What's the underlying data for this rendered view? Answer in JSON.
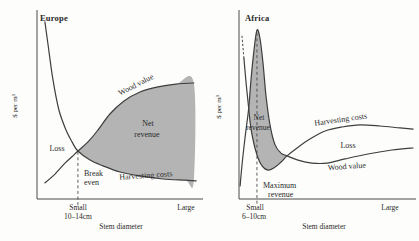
{
  "figure": {
    "background": "#fdfdfb",
    "line_color": "#3e3e3e",
    "shade_color": "#b4b4b4",
    "text_color": "#2a2a2a"
  },
  "chart_data": [
    {
      "type": "line",
      "title": "Europe",
      "xlabel": "Stem diameter",
      "ylabel": "$ per m³",
      "x_axis": "qualitative, Small (10–14cm) to Large",
      "y_axis": "qualitative, $ per m³ (no numeric ticks)",
      "grid": false,
      "legend_position": "labels on curves",
      "series_names": [
        "Harvesting costs",
        "Wood value"
      ],
      "shaded_region_meaning": "Net revenue (area where wood value exceeds harvesting costs, right of break-even point)",
      "annotation": "Break even at Small (10–14cm) stem diameter; Loss region left of break-even",
      "labels": {
        "title": "Europe",
        "ylabel": "$ per m³",
        "wood_value": "Wood value",
        "harvesting": "Harvesting costs",
        "net_line1": "Net",
        "net_line2": "revenue",
        "loss": "Loss",
        "break_line1": "Break",
        "break_line2": "even",
        "tick_small": "Small",
        "tick_small_size": "10–14cm",
        "tick_large": "Large",
        "xlabel": "Stem diameter"
      },
      "curves": {
        "harvesting": [
          [
            0.048,
            0.937
          ],
          [
            0.067,
            0.815
          ],
          [
            0.097,
            0.63
          ],
          [
            0.133,
            0.471
          ],
          [
            0.176,
            0.365
          ],
          [
            0.212,
            0.302
          ],
          [
            0.248,
            0.254
          ],
          [
            0.321,
            0.206
          ],
          [
            0.4,
            0.175
          ],
          [
            0.503,
            0.143
          ],
          [
            0.624,
            0.122
          ],
          [
            0.764,
            0.106
          ],
          [
            0.897,
            0.1
          ],
          [
            0.964,
            0.096
          ]
        ],
        "wood": [
          [
            0.048,
            0.085
          ],
          [
            0.109,
            0.132
          ],
          [
            0.17,
            0.19
          ],
          [
            0.215,
            0.226
          ],
          [
            0.248,
            0.254
          ],
          [
            0.309,
            0.302
          ],
          [
            0.37,
            0.365
          ],
          [
            0.442,
            0.45
          ],
          [
            0.527,
            0.519
          ],
          [
            0.624,
            0.566
          ],
          [
            0.733,
            0.593
          ],
          [
            0.842,
            0.608
          ],
          [
            0.95,
            0.614
          ]
        ]
      },
      "region": [
        [
          0.248,
          0.254
        ],
        [
          0.309,
          0.302
        ],
        [
          0.37,
          0.365
        ],
        [
          0.442,
          0.45
        ],
        [
          0.527,
          0.519
        ],
        [
          0.624,
          0.566
        ],
        [
          0.733,
          0.593
        ],
        [
          0.842,
          0.608
        ],
        [
          0.95,
          0.614
        ],
        [
          0.95,
          0.096
        ],
        [
          0.897,
          0.1
        ],
        [
          0.764,
          0.106
        ],
        [
          0.624,
          0.122
        ],
        [
          0.503,
          0.143
        ],
        [
          0.4,
          0.175
        ],
        [
          0.321,
          0.206
        ]
      ],
      "marker_line": {
        "x": 0.248,
        "y1": 0.25,
        "y2": -0.037
      }
    },
    {
      "type": "line",
      "title": "Africa",
      "xlabel": "Stem diameter",
      "ylabel": "$ per m³",
      "x_axis": "qualitative, Small (6–10cm) to Large",
      "y_axis": "qualitative, $ per m³ (no numeric ticks)",
      "grid": false,
      "legend_position": "labels on curves",
      "series_names": [
        "Harvesting costs",
        "Wood value"
      ],
      "shaded_region_meaning": "Net revenue (narrow peak at small stem diameters where wood value exceeds harvesting costs)",
      "annotation": "Maximum revenue at Small (6–10cm) stem diameter; Loss region at larger diameters where harvesting costs exceed wood value; harvesting-costs curve dotted where it runs off-scale at smallest diameters",
      "labels": {
        "title": "Africa",
        "ylabel": "$ per m³",
        "wood_value": "Wood value",
        "harvesting": "Harvesting costs",
        "net_line1": "Net",
        "net_line2": "revenue",
        "loss": "Loss",
        "max_line1": "Maximum",
        "max_line2": "revenue",
        "tick_small": "Small",
        "tick_small_size": "6–10cm",
        "tick_large": "Large",
        "xlabel": "Stem diameter"
      },
      "curves": {
        "harvesting_dotted": [
          [
            0.017,
            0.862
          ],
          [
            0.028,
            0.746
          ]
        ],
        "harvesting": [
          [
            0.028,
            0.746
          ],
          [
            0.04,
            0.619
          ],
          [
            0.055,
            0.48
          ],
          [
            0.063,
            0.407
          ],
          [
            0.08,
            0.312
          ],
          [
            0.102,
            0.233
          ],
          [
            0.131,
            0.175
          ],
          [
            0.165,
            0.153
          ],
          [
            0.205,
            0.169
          ],
          [
            0.239,
            0.196
          ],
          [
            0.273,
            0.228
          ],
          [
            0.33,
            0.27
          ],
          [
            0.403,
            0.317
          ],
          [
            0.489,
            0.36
          ],
          [
            0.585,
            0.381
          ],
          [
            0.688,
            0.392
          ],
          [
            0.801,
            0.386
          ],
          [
            0.915,
            0.376
          ],
          [
            0.989,
            0.37
          ]
        ],
        "wood": [
          [
            0.006,
            0.069
          ],
          [
            0.017,
            0.18
          ],
          [
            0.034,
            0.323
          ],
          [
            0.055,
            0.48
          ],
          [
            0.068,
            0.63
          ],
          [
            0.085,
            0.788
          ],
          [
            0.102,
            0.894
          ],
          [
            0.119,
            0.852
          ],
          [
            0.136,
            0.725
          ],
          [
            0.153,
            0.55
          ],
          [
            0.176,
            0.392
          ],
          [
            0.205,
            0.286
          ],
          [
            0.239,
            0.243
          ],
          [
            0.273,
            0.228
          ],
          [
            0.335,
            0.206
          ],
          [
            0.415,
            0.19
          ],
          [
            0.5,
            0.19
          ],
          [
            0.602,
            0.212
          ],
          [
            0.733,
            0.238
          ],
          [
            0.869,
            0.259
          ],
          [
            0.989,
            0.27
          ]
        ]
      },
      "region": [
        [
          0.055,
          0.48
        ],
        [
          0.068,
          0.63
        ],
        [
          0.085,
          0.788
        ],
        [
          0.102,
          0.894
        ],
        [
          0.119,
          0.852
        ],
        [
          0.136,
          0.725
        ],
        [
          0.153,
          0.55
        ],
        [
          0.176,
          0.392
        ],
        [
          0.205,
          0.286
        ],
        [
          0.239,
          0.243
        ],
        [
          0.273,
          0.228
        ],
        [
          0.239,
          0.196
        ],
        [
          0.205,
          0.169
        ],
        [
          0.165,
          0.153
        ],
        [
          0.131,
          0.175
        ],
        [
          0.102,
          0.233
        ],
        [
          0.08,
          0.312
        ],
        [
          0.063,
          0.407
        ]
      ],
      "marker_line": {
        "x": 0.102,
        "y1": 0.88,
        "y2": -0.037
      }
    }
  ]
}
